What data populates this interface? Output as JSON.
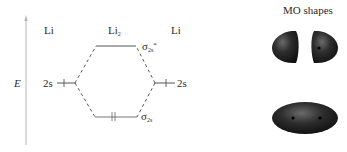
{
  "diagram": {
    "axis_label": "E",
    "left_atom": "Li",
    "molecule": "Li",
    "molecule_subscript": "2",
    "right_atom": "Li",
    "left_ao": {
      "label": "2s",
      "electrons": 1
    },
    "right_ao": {
      "label": "2s",
      "electrons": 1
    },
    "antibonding_mo": {
      "symbol": "σ",
      "subscript": "2s",
      "superscript": "*",
      "electrons": 0
    },
    "bonding_mo": {
      "symbol": "σ",
      "subscript": "2s",
      "electrons": 2,
      "electron_glyph": "↑↓"
    },
    "colors": {
      "line": "#555555",
      "dashed": "#444444",
      "axis": "#b0b0b0",
      "lobe": "#2a2a2a"
    }
  },
  "mo_shapes": {
    "title": "MO shapes",
    "antibonding_shape": "two-separated-lobes",
    "bonding_shape": "single-ellipsoid"
  }
}
